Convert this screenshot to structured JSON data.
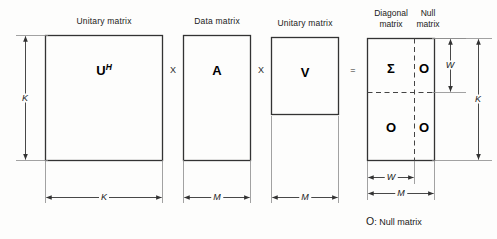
{
  "diagram": {
    "labels": {
      "unitary_matrix_u": "Unitary matrix",
      "data_matrix": "Data matrix",
      "unitary_matrix_v": "Unitary matrix",
      "diagonal_matrix_line1": "Diagonal",
      "diagonal_matrix_line2": "matrix",
      "null_matrix_line1": "Null",
      "null_matrix_line2": "matrix"
    },
    "matrices": {
      "u_hermitian": "U",
      "u_hermitian_sup": "H",
      "a": "A",
      "v": "V",
      "sigma": "Σ",
      "null_top_right": "O",
      "null_bottom_left": "O",
      "null_bottom_right": "O"
    },
    "operators": {
      "times_1": "X",
      "times_2": "X",
      "equals": "="
    },
    "dimensions": {
      "u_height": "K",
      "u_width": "K",
      "a_width": "M",
      "v_width": "M",
      "result_top_height": "W",
      "result_total_height": "K",
      "result_sigma_width": "W",
      "result_total_width": "M"
    },
    "caption": {
      "symbol": "O",
      "text": ":  Null matrix"
    },
    "colors": {
      "stroke": "#333333",
      "thin_stroke": "#8a8a8a",
      "dashed": "#444444",
      "background": "#fdfdfc",
      "text": "#1a1a1a"
    }
  }
}
